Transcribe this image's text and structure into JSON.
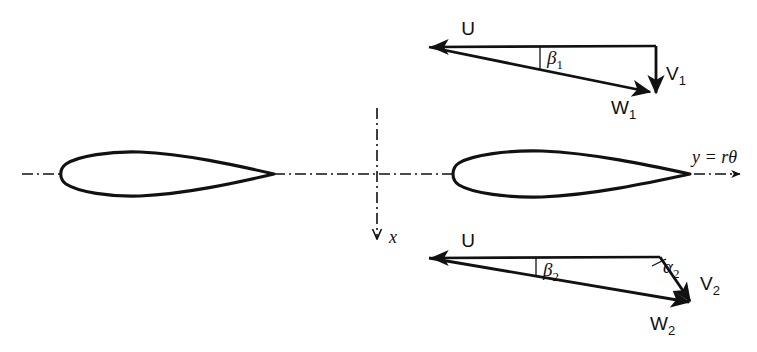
{
  "figure": {
    "background_color": "#ffffff",
    "stroke_color": "#111111",
    "width": 757,
    "height": 352
  },
  "axes": {
    "horizontal": {
      "label": "y = rθ",
      "name": "tangential-axis",
      "style": "dash-dot",
      "arrow": "right"
    },
    "vertical": {
      "label": "x",
      "name": "axial-axis",
      "style": "dash-dot",
      "arrow": "down"
    }
  },
  "blades": [
    {
      "name": "blade-upper",
      "label": ""
    },
    {
      "name": "blade-lower",
      "label": ""
    }
  ],
  "inlet_triangle": {
    "name": "inlet-velocity-triangle",
    "vectors": [
      {
        "key": "U",
        "label": "U",
        "sub": "",
        "name": "inlet-blade-speed-vector"
      },
      {
        "key": "V1",
        "label": "V",
        "sub": "1",
        "name": "inlet-absolute-velocity-vector"
      },
      {
        "key": "W1",
        "label": "W",
        "sub": "1",
        "name": "inlet-relative-velocity-vector"
      }
    ],
    "angles": [
      {
        "key": "beta1",
        "label": "β",
        "sub": "1",
        "name": "inlet-relative-flow-angle"
      }
    ]
  },
  "outlet_triangle": {
    "name": "outlet-velocity-triangle",
    "vectors": [
      {
        "key": "U",
        "label": "U",
        "sub": "",
        "name": "outlet-blade-speed-vector"
      },
      {
        "key": "V2",
        "label": "V",
        "sub": "2",
        "name": "outlet-absolute-velocity-vector"
      },
      {
        "key": "W2",
        "label": "W",
        "sub": "2",
        "name": "outlet-relative-velocity-vector"
      }
    ],
    "angles": [
      {
        "key": "beta2",
        "label": "β",
        "sub": "2",
        "name": "outlet-relative-flow-angle"
      },
      {
        "key": "alpha2",
        "label": "α",
        "sub": "2",
        "name": "outlet-absolute-flow-angle"
      }
    ]
  }
}
